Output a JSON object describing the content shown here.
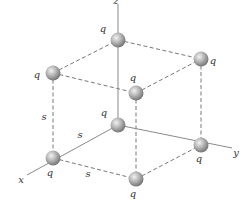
{
  "diagram": {
    "axes": [
      {
        "name": "x",
        "label": "x",
        "from": [
          118,
          125
        ],
        "to": [
          27,
          175
        ],
        "label_pos": [
          21,
          183
        ]
      },
      {
        "name": "y",
        "label": "y",
        "from": [
          118,
          125
        ],
        "to": [
          232,
          148
        ],
        "label_pos": [
          236,
          156
        ]
      },
      {
        "name": "z",
        "label": "z",
        "from": [
          118,
          125
        ],
        "to": [
          118,
          4
        ],
        "label_pos": [
          116,
          4
        ]
      }
    ],
    "charges": [
      {
        "id": "top-back",
        "label": "q",
        "cx": 118,
        "cy": 40,
        "label_pos": [
          103,
          32
        ]
      },
      {
        "id": "top-left",
        "label": "q",
        "cx": 53,
        "cy": 73,
        "label_pos": [
          37,
          78
        ]
      },
      {
        "id": "top-right",
        "label": "q",
        "cx": 201,
        "cy": 59,
        "label_pos": [
          213,
          64
        ]
      },
      {
        "id": "top-front",
        "label": "q",
        "cx": 136,
        "cy": 93,
        "label_pos": [
          133,
          81
        ]
      },
      {
        "id": "origin",
        "label": "q",
        "cx": 118,
        "cy": 125,
        "label_pos": [
          104,
          116
        ]
      },
      {
        "id": "bottom-left",
        "label": "q",
        "cx": 53,
        "cy": 158,
        "label_pos": [
          50,
          176
        ]
      },
      {
        "id": "bottom-right",
        "label": "q",
        "cx": 201,
        "cy": 145,
        "label_pos": [
          199,
          162
        ]
      },
      {
        "id": "bottom-front",
        "label": "q",
        "cx": 136,
        "cy": 179,
        "label_pos": [
          133,
          197
        ]
      }
    ],
    "dashed_edges": [
      [
        53,
        73,
        118,
        40
      ],
      [
        118,
        40,
        201,
        59
      ],
      [
        53,
        73,
        136,
        93
      ],
      [
        136,
        93,
        201,
        59
      ],
      [
        53,
        73,
        53,
        158
      ],
      [
        201,
        59,
        201,
        145
      ],
      [
        136,
        93,
        136,
        179
      ],
      [
        53,
        158,
        136,
        179
      ],
      [
        136,
        179,
        201,
        145
      ]
    ],
    "side_labels": [
      {
        "label": "s",
        "pos": [
          44,
          120
        ]
      },
      {
        "label": "s",
        "pos": [
          80,
          138
        ]
      },
      {
        "label": "s",
        "pos": [
          88,
          177
        ]
      }
    ],
    "colors": {
      "sphere_light": "#f2f2f2",
      "sphere_mid": "#b8b8b8",
      "sphere_dark": "#6e6e6e",
      "axis": "#8a8a8a",
      "edge": "#555555",
      "text": "#333333"
    }
  }
}
